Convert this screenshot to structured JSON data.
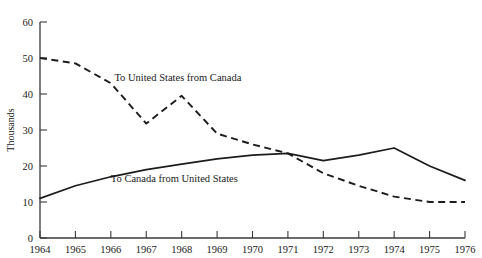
{
  "chart_data": {
    "type": "line",
    "title": "",
    "xlabel": "",
    "ylabel": "Thousands",
    "x": [
      1964,
      1965,
      1966,
      1967,
      1968,
      1969,
      1970,
      1971,
      1972,
      1973,
      1974,
      1975,
      1976
    ],
    "xtick_labels": [
      "1964",
      "1965",
      "1966",
      "1967",
      "1968",
      "1969",
      "1970",
      "1971",
      "1972",
      "1973",
      "1974",
      "1975",
      "1976"
    ],
    "ytick_labels": [
      "0",
      "10",
      "20",
      "30",
      "40",
      "50",
      "60"
    ],
    "yticks": [
      0,
      10,
      20,
      30,
      40,
      50,
      60
    ],
    "ylim": [
      0,
      60
    ],
    "xlim": [
      1964,
      1976
    ],
    "grid": false,
    "legend_position": "inline-annotation",
    "series": [
      {
        "name": "To United States from Canada",
        "style": "dashed",
        "color": "#1c1c1c",
        "label_x": 1966.1,
        "label_y": 43.5,
        "values": [
          50,
          48.5,
          43,
          31.8,
          39.5,
          29,
          26,
          23.5,
          18,
          14.5,
          11.5,
          10,
          10
        ]
      },
      {
        "name": "To Canada from United States",
        "style": "solid",
        "color": "#1c1c1c",
        "label_x": 1966.0,
        "label_y": 15.6,
        "values": [
          11,
          14.5,
          17,
          19,
          20.5,
          22,
          23,
          23.5,
          21.5,
          23,
          25,
          20,
          16
        ]
      }
    ]
  }
}
